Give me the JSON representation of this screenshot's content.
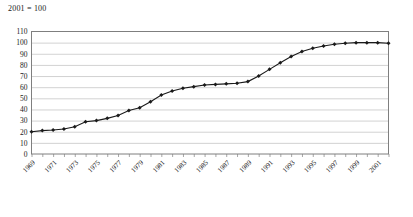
{
  "chart_data": {
    "type": "line",
    "title": "2001 = 100",
    "xlabel": "",
    "ylabel": "",
    "ylim": [
      0,
      110
    ],
    "ytick_step": 10,
    "yticks": [
      0,
      10,
      20,
      30,
      40,
      50,
      60,
      70,
      80,
      90,
      100,
      110
    ],
    "grid": true,
    "grid_axis": "y",
    "legend": false,
    "legend_position": "none",
    "marker": "diamond",
    "line_color": "#1a1a1a",
    "marker_color": "#1a1a1a",
    "grid_color": "#bfbfbf",
    "axis_color": "#7f7f7f",
    "xtick_labels": [
      "1969",
      "1971",
      "1973",
      "1975",
      "1977",
      "1979",
      "1981",
      "1983",
      "1985",
      "1987",
      "1989",
      "1991",
      "1993",
      "1995",
      "1997",
      "1999",
      "2001"
    ],
    "xtick_rotation": 45,
    "x": [
      1969,
      1970,
      1971,
      1972,
      1973,
      1974,
      1975,
      1976,
      1977,
      1978,
      1979,
      1980,
      1981,
      1982,
      1983,
      1984,
      1985,
      1986,
      1987,
      1988,
      1989,
      1990,
      1991,
      1992,
      1993,
      1994,
      1995,
      1996,
      1997,
      1998,
      1999,
      2000,
      2001,
      2002
    ],
    "values": [
      20,
      21,
      21.5,
      22.5,
      24.5,
      29,
      30,
      32,
      34.5,
      39,
      41.5,
      47,
      53,
      56.5,
      59,
      60.5,
      62,
      62.5,
      63,
      63.5,
      65,
      70,
      76,
      82,
      87.5,
      92,
      95,
      97,
      98.5,
      99.5,
      100,
      100,
      100,
      99.5
    ]
  }
}
